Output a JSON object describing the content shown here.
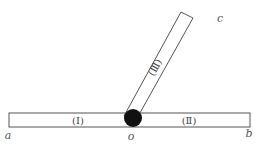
{
  "diagram": {
    "points": {
      "a": "a",
      "o": "o",
      "b": "b",
      "c": "c"
    },
    "rods": {
      "rod1": "(Ⅰ)",
      "rod2": "(Ⅱ)",
      "rod3": "(Ⅲ)"
    },
    "colors": {
      "stroke": "#555555",
      "fill": "#ffffff",
      "pivot": "#111111"
    }
  }
}
